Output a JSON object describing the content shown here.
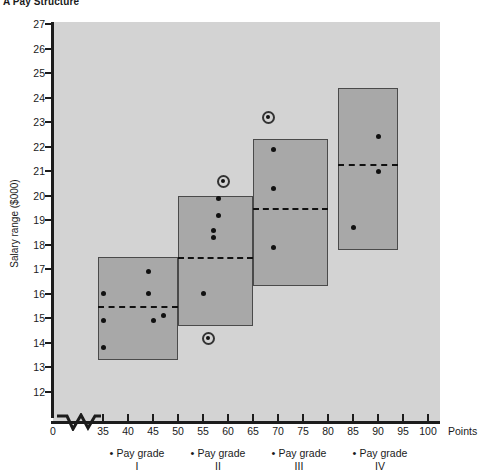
{
  "title": "A Pay Structure",
  "axes": {
    "y_label": "Salary range ($000)",
    "x_label": "Points",
    "y_ticks": [
      27,
      26,
      25,
      24,
      23,
      22,
      21,
      20,
      19,
      18,
      17,
      16,
      15,
      14,
      13,
      12
    ],
    "x_ticks": [
      0,
      35,
      40,
      45,
      50,
      55,
      60,
      65,
      70,
      75,
      80,
      85,
      90,
      95,
      100
    ]
  },
  "grades": [
    {
      "name": "Pay grade",
      "roman": "I",
      "bullet": "•"
    },
    {
      "name": "Pay grade",
      "roman": "II",
      "bullet": "•"
    },
    {
      "name": "Pay grade",
      "roman": "III",
      "bullet": "•"
    },
    {
      "name": "Pay grade",
      "roman": "IV",
      "bullet": "•"
    }
  ],
  "colors": {
    "plot_background": "#d3d3d3",
    "box_fill": "#a8a8a8",
    "box_border": "#4a4a4a",
    "axis": "#1c1c1c",
    "point": "#111111"
  },
  "chart_data": {
    "type": "scatter",
    "title": "A Pay Structure",
    "xlabel": "Points",
    "ylabel": "Salary range ($000)",
    "xlim": [
      33,
      102
    ],
    "ylim": [
      12,
      27
    ],
    "grid": false,
    "legend": "none",
    "x_axis_break": true,
    "pay_grade_ranges": [
      {
        "grade": "I",
        "point_min": 34,
        "point_max": 50,
        "salary_min": 13.3,
        "salary_max": 17.5,
        "midpoint": 15.5,
        "employees": [
          {
            "points": 35,
            "salary": 16.0
          },
          {
            "points": 35,
            "salary": 14.9
          },
          {
            "points": 35,
            "salary": 13.8
          },
          {
            "points": 44,
            "salary": 16.9
          },
          {
            "points": 44,
            "salary": 16.0
          },
          {
            "points": 45,
            "salary": 14.9
          },
          {
            "points": 47,
            "salary": 15.1
          }
        ]
      },
      {
        "grade": "II",
        "point_min": 50,
        "point_max": 65,
        "salary_min": 14.7,
        "salary_max": 20.0,
        "midpoint": 17.5,
        "employees": [
          {
            "points": 55,
            "salary": 16.0
          },
          {
            "points": 57,
            "salary": 18.3
          },
          {
            "points": 57,
            "salary": 18.6
          },
          {
            "points": 58,
            "salary": 19.2
          },
          {
            "points": 58,
            "salary": 19.9
          }
        ],
        "outliers": [
          {
            "points": 59,
            "salary": 20.6
          },
          {
            "points": 56,
            "salary": 14.2
          }
        ]
      },
      {
        "grade": "III",
        "point_min": 65,
        "point_max": 80,
        "salary_min": 16.3,
        "salary_max": 22.3,
        "midpoint": 19.5,
        "employees": [
          {
            "points": 69,
            "salary": 21.9
          },
          {
            "points": 69,
            "salary": 20.3
          },
          {
            "points": 69,
            "salary": 17.9
          }
        ],
        "outliers": [
          {
            "points": 68,
            "salary": 23.2
          }
        ]
      },
      {
        "grade": "IV",
        "point_min": 82,
        "point_max": 94,
        "salary_min": 17.8,
        "salary_max": 24.4,
        "midpoint": 21.3,
        "employees": [
          {
            "points": 90,
            "salary": 22.4
          },
          {
            "points": 90,
            "salary": 21.0
          },
          {
            "points": 85,
            "salary": 18.7
          }
        ]
      }
    ]
  }
}
